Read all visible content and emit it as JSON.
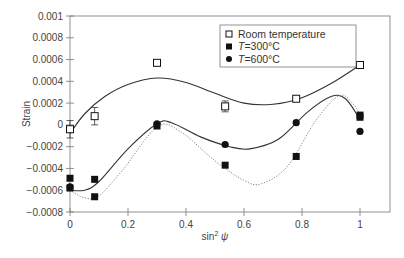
{
  "chart_data": {
    "type": "scatter",
    "title": "",
    "xlabel": "sin² ψ",
    "ylabel": "Strain",
    "xlim": [
      0,
      1.1
    ],
    "ylim": [
      -0.0008,
      0.001
    ],
    "xticks": [
      "0",
      "0.2",
      "0.4",
      "0.6",
      "0.8",
      "1"
    ],
    "xtick_values": [
      0,
      0.2,
      0.4,
      0.6,
      0.8,
      1
    ],
    "yticks": [
      "0.001",
      "0.0008",
      "0.0006",
      "0.0004",
      "0.0002",
      "0",
      "−0.0002",
      "−0.0004",
      "−0.0006",
      "−0.0008"
    ],
    "ytick_values": [
      0.001,
      0.0008,
      0.0006,
      0.0004,
      0.0002,
      0,
      -0.0002,
      -0.0004,
      -0.0006,
      -0.0008
    ],
    "grid": false,
    "legend_position": "upper right",
    "series": [
      {
        "name": "Room temperature",
        "marker": "open-square",
        "fit_line": "solid",
        "error_bars": true,
        "points": [
          [
            0,
            -4e-05
          ],
          [
            0.085,
            8e-05
          ],
          [
            0.3,
            0.00057
          ],
          [
            0.535,
            0.00017
          ],
          [
            0.78,
            0.00024
          ],
          [
            1,
            0.00055
          ]
        ],
        "error": [
          8e-05,
          8e-05,
          1e-05,
          5e-05,
          1e-05,
          2e-05
        ]
      },
      {
        "name": "T = 300°C",
        "marker": "filled-square",
        "fit_line": "dotted",
        "points": [
          [
            0,
            -0.00049
          ],
          [
            0,
            -0.00058
          ],
          [
            0.085,
            -0.0005
          ],
          [
            0.085,
            -0.00066
          ],
          [
            0.3,
            -1e-05
          ],
          [
            0.535,
            -0.00037
          ],
          [
            0.78,
            -0.00029
          ],
          [
            1,
            7e-05
          ],
          [
            1,
            9e-05
          ]
        ]
      },
      {
        "name": "T = 600°C",
        "marker": "filled-circle",
        "fit_line": "solid",
        "points": [
          [
            0,
            -0.00057
          ],
          [
            0.3,
            1e-05
          ],
          [
            0.535,
            -0.00018
          ],
          [
            0.78,
            2e-05
          ],
          [
            1,
            -6e-05
          ]
        ]
      }
    ],
    "curves": {
      "room_temperature": [
        [
          0,
          -8e-05
        ],
        [
          0.05,
          0.0001
        ],
        [
          0.12,
          0.00026
        ],
        [
          0.2,
          0.00037
        ],
        [
          0.3,
          0.00043
        ],
        [
          0.4,
          0.00039
        ],
        [
          0.5,
          0.00029
        ],
        [
          0.6,
          0.0002
        ],
        [
          0.7,
          0.00019
        ],
        [
          0.8,
          0.00025
        ],
        [
          0.9,
          0.00038
        ],
        [
          1,
          0.00055
        ]
      ],
      "t600_solid": [
        [
          0,
          -0.0006
        ],
        [
          0.05,
          -0.0006
        ],
        [
          0.1,
          -0.00052
        ],
        [
          0.2,
          -0.00022
        ],
        [
          0.3,
          1e-05
        ],
        [
          0.35,
          2e-05
        ],
        [
          0.45,
          -0.00011
        ],
        [
          0.55,
          -0.0002
        ],
        [
          0.62,
          -0.00022
        ],
        [
          0.72,
          -0.00013
        ],
        [
          0.82,
          0.00012
        ],
        [
          0.9,
          0.00026
        ],
        [
          0.95,
          0.00024
        ],
        [
          1,
          5e-05
        ]
      ],
      "t300_dotted": [
        [
          0,
          -0.0006
        ],
        [
          0.05,
          -0.00067
        ],
        [
          0.1,
          -0.00065
        ],
        [
          0.18,
          -0.00042
        ],
        [
          0.3,
          -2e-05
        ],
        [
          0.38,
          -6e-05
        ],
        [
          0.5,
          -0.00033
        ],
        [
          0.6,
          -0.00051
        ],
        [
          0.66,
          -0.00054
        ],
        [
          0.75,
          -0.00038
        ],
        [
          0.85,
          5e-05
        ],
        [
          0.93,
          0.00027
        ],
        [
          0.98,
          0.00018
        ],
        [
          1,
          9e-05
        ]
      ]
    }
  },
  "legend": {
    "items": [
      {
        "label": "Room temperature",
        "marker": "open-square"
      },
      {
        "label": "T = 300°C",
        "marker": "filled-square"
      },
      {
        "label": "T = 600°C",
        "marker": "filled-circle"
      }
    ]
  },
  "colors": {
    "axis": "#777777",
    "line": "#333333",
    "marker_fill": "#111111",
    "text": "#444444"
  }
}
